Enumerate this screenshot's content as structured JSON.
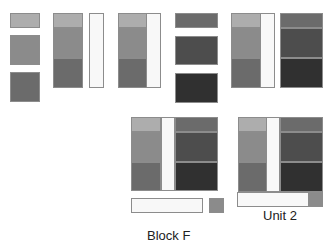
{
  "labels": {
    "block_f": "Block F",
    "unit_2": "Unit 2"
  },
  "colors": {
    "light_1": "#adadad",
    "light_2": "#8b8b8b",
    "light_3": "#6b6b6b",
    "dark_1": "#6b6b6b",
    "dark_2": "#4d4d4d",
    "dark_3": "#303030",
    "strip": "#f8f8f8"
  }
}
